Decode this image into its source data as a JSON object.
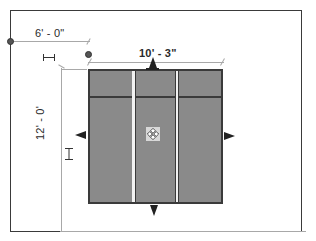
{
  "drawing": {
    "type": "plan-view",
    "element": "curtain-wall-panel-grid",
    "panel_columns": 3,
    "panel_rows": 2
  },
  "dimensions": {
    "offset": {
      "label": "6' - 0\"",
      "orientation": "horizontal"
    },
    "width": {
      "label": "10' - 3\"",
      "orientation": "horizontal"
    },
    "height": {
      "label": "12' - 0'",
      "orientation": "vertical"
    }
  },
  "controls": {
    "grips": [
      "arrow-up-grip",
      "arrow-down-grip",
      "arrow-left-grip",
      "arrow-right-grip"
    ],
    "move_icon": "move-handle-icon",
    "lock_icons": [
      "dimension-lock-icon-offset",
      "dimension-lock-icon-height"
    ]
  },
  "colors": {
    "panel_fill": "#8a8a8a",
    "frame_stroke": "#3a3a3a",
    "dimension_line": "#a8a8a8",
    "background": "#ffffff"
  }
}
